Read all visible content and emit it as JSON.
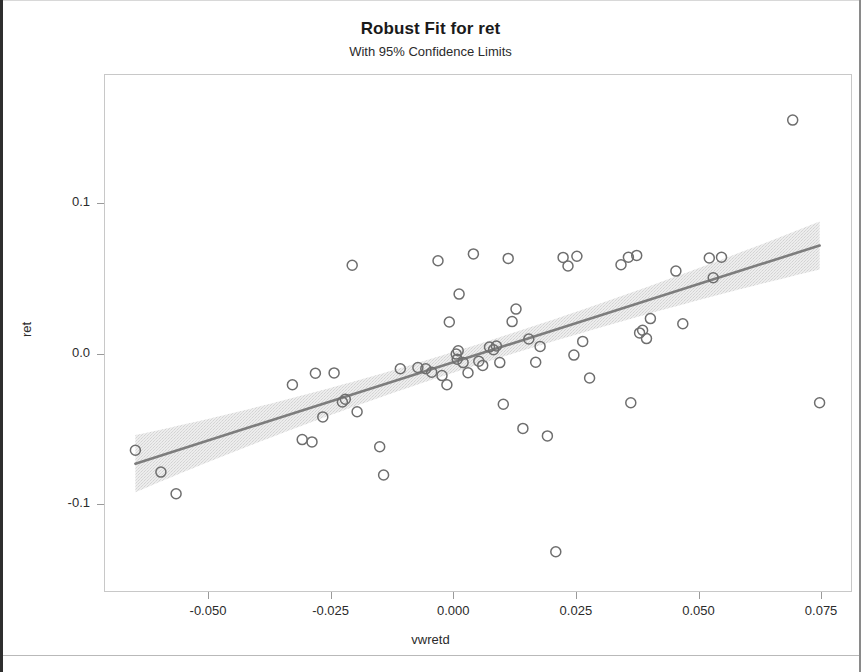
{
  "chart_data": {
    "type": "scatter",
    "title": "Robust Fit for ret",
    "subtitle": "With 95% Confidence Limits",
    "xlabel": "vwretd",
    "ylabel": "ret",
    "xlim": [
      -0.0712,
      0.0813
    ],
    "ylim": [
      -0.1585,
      0.186
    ],
    "xticks": [
      -0.05,
      -0.025,
      0.0,
      0.025,
      0.05,
      0.075
    ],
    "xtick_labels": [
      "-0.050",
      "-0.025",
      "0.000",
      "0.025",
      "0.050",
      "0.075"
    ],
    "yticks": [
      0.1,
      0.0,
      -0.1
    ],
    "ytick_labels": [
      "0.1",
      "0.0",
      "-0.1"
    ],
    "grid": false,
    "legend": null,
    "marker": "open-circle",
    "marker_color": "#6e6e6e",
    "fit_line_color": "#7d7d7d",
    "band_color": "#e3e3e3",
    "frame_color": "#c8c8c8",
    "background": "#ffffff",
    "fit": {
      "name": "robust regression line",
      "intercept": -0.0049,
      "slope": 1.04,
      "x_start": -0.065,
      "x_end": 0.0745
    },
    "confidence_band": {
      "level": "95%",
      "label": "With 95% Confidence Limits",
      "half_width_at_x_start": 0.019,
      "half_width_at_center": 0.0068,
      "half_width_at_x_end": 0.016
    },
    "points": [
      {
        "x": -0.065,
        "y": -0.0636
      },
      {
        "x": -0.0598,
        "y": -0.0781
      },
      {
        "x": -0.0567,
        "y": -0.0925
      },
      {
        "x": -0.033,
        "y": -0.02
      },
      {
        "x": -0.031,
        "y": -0.0565
      },
      {
        "x": -0.029,
        "y": -0.058
      },
      {
        "x": -0.0283,
        "y": -0.0123
      },
      {
        "x": -0.0268,
        "y": -0.0414
      },
      {
        "x": -0.0245,
        "y": -0.0121
      },
      {
        "x": -0.0228,
        "y": -0.0315
      },
      {
        "x": -0.0222,
        "y": -0.0297
      },
      {
        "x": -0.0208,
        "y": 0.0595
      },
      {
        "x": -0.0198,
        "y": -0.038
      },
      {
        "x": -0.0152,
        "y": -0.0613
      },
      {
        "x": -0.0144,
        "y": -0.08
      },
      {
        "x": -0.011,
        "y": -0.0093
      },
      {
        "x": -0.0074,
        "y": -0.0085
      },
      {
        "x": -0.0058,
        "y": -0.0093
      },
      {
        "x": -0.0046,
        "y": -0.0117
      },
      {
        "x": -0.0033,
        "y": 0.0625
      },
      {
        "x": -0.0025,
        "y": -0.0139
      },
      {
        "x": -0.0015,
        "y": -0.02
      },
      {
        "x": -0.001,
        "y": 0.0217
      },
      {
        "x": 0.0004,
        "y": 0.0004
      },
      {
        "x": 0.0006,
        "y": -0.0031
      },
      {
        "x": 0.0008,
        "y": 0.0026
      },
      {
        "x": 0.001,
        "y": 0.0403
      },
      {
        "x": 0.0018,
        "y": -0.0053
      },
      {
        "x": 0.0028,
        "y": -0.012
      },
      {
        "x": 0.0039,
        "y": 0.067
      },
      {
        "x": 0.005,
        "y": -0.0044
      },
      {
        "x": 0.0058,
        "y": -0.0071
      },
      {
        "x": 0.0072,
        "y": 0.0051
      },
      {
        "x": 0.008,
        "y": 0.0033
      },
      {
        "x": 0.0086,
        "y": 0.0058
      },
      {
        "x": 0.0093,
        "y": -0.0053
      },
      {
        "x": 0.01,
        "y": -0.033
      },
      {
        "x": 0.011,
        "y": 0.064
      },
      {
        "x": 0.0118,
        "y": 0.022
      },
      {
        "x": 0.0126,
        "y": 0.0303
      },
      {
        "x": 0.014,
        "y": -0.049
      },
      {
        "x": 0.0152,
        "y": 0.0104
      },
      {
        "x": 0.0166,
        "y": -0.005
      },
      {
        "x": 0.0175,
        "y": 0.0055
      },
      {
        "x": 0.019,
        "y": -0.054
      },
      {
        "x": 0.0207,
        "y": -0.131
      },
      {
        "x": 0.0222,
        "y": 0.0647
      },
      {
        "x": 0.0232,
        "y": 0.059
      },
      {
        "x": 0.0244,
        "y": -0.0003
      },
      {
        "x": 0.025,
        "y": 0.0655
      },
      {
        "x": 0.0262,
        "y": 0.0088
      },
      {
        "x": 0.0276,
        "y": -0.0155
      },
      {
        "x": 0.034,
        "y": 0.0598
      },
      {
        "x": 0.0355,
        "y": 0.0648
      },
      {
        "x": 0.036,
        "y": -0.032
      },
      {
        "x": 0.0372,
        "y": 0.066
      },
      {
        "x": 0.0378,
        "y": 0.0145
      },
      {
        "x": 0.0384,
        "y": 0.0163
      },
      {
        "x": 0.0392,
        "y": 0.0107
      },
      {
        "x": 0.04,
        "y": 0.024
      },
      {
        "x": 0.0452,
        "y": 0.0556
      },
      {
        "x": 0.0466,
        "y": 0.0206
      },
      {
        "x": 0.052,
        "y": 0.0643
      },
      {
        "x": 0.0528,
        "y": 0.0512
      },
      {
        "x": 0.0545,
        "y": 0.0648
      },
      {
        "x": 0.069,
        "y": 0.156
      },
      {
        "x": 0.0745,
        "y": -0.032
      }
    ]
  },
  "figure": {
    "title": "Robust Fit for ret",
    "subtitle": "With 95% Confidence Limits",
    "x_axis_title": "vwretd",
    "y_axis_title": "ret"
  }
}
